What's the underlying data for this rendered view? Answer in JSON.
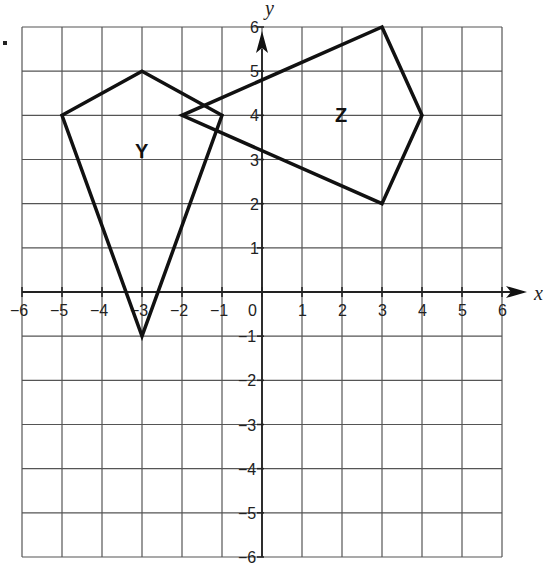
{
  "grid": {
    "xmin": -6,
    "xmax": 6,
    "ymin": -6,
    "ymax": 6,
    "px": {
      "left": 22,
      "right": 502,
      "top": 27,
      "bottom": 557
    }
  },
  "axes": {
    "x_label": "x",
    "y_label": "y",
    "x_ticks": [
      "-6",
      "-5",
      "-4",
      "-3",
      "-2",
      "-1",
      "0",
      "1",
      "2",
      "3",
      "4",
      "5",
      "6"
    ],
    "y_ticks": [
      "6",
      "5",
      "4",
      "3",
      "2",
      "1",
      "-1",
      "-2",
      "-3",
      "-4",
      "-5",
      "-6"
    ]
  },
  "shapes": [
    {
      "name": "Y",
      "vertices": [
        [
          -3,
          5
        ],
        [
          -1,
          4
        ],
        [
          -3,
          -1
        ],
        [
          -5,
          4
        ]
      ],
      "label_pos": [
        -3,
        3.2
      ]
    },
    {
      "name": "Z",
      "vertices": [
        [
          3,
          6
        ],
        [
          4,
          4
        ],
        [
          3,
          2
        ],
        [
          -2,
          4
        ]
      ],
      "label_pos": [
        2,
        4
      ]
    }
  ],
  "chart_data": {
    "type": "scatter",
    "title": "",
    "xlabel": "x",
    "ylabel": "y",
    "xlim": [
      -6,
      6
    ],
    "ylim": [
      -6,
      6
    ],
    "grid": true,
    "series": [
      {
        "name": "Y",
        "points": [
          [
            -3,
            5
          ],
          [
            -1,
            4
          ],
          [
            -3,
            -1
          ],
          [
            -5,
            4
          ]
        ]
      },
      {
        "name": "Z",
        "points": [
          [
            3,
            6
          ],
          [
            4,
            4
          ],
          [
            3,
            2
          ],
          [
            -2,
            4
          ]
        ]
      }
    ]
  }
}
